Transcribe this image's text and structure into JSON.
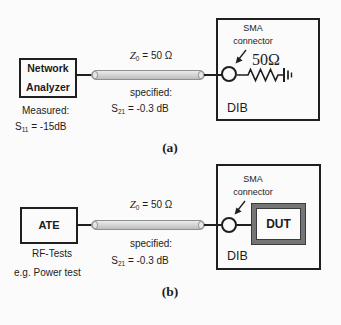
{
  "figure": {
    "colors": {
      "stroke": "#1f1f1f",
      "coax_fill": "#d6d6d6",
      "coax_border": "#8f8f8f",
      "dut_border": "#757575",
      "background": "#fbfbfb"
    },
    "panel_a": {
      "device_line1": "Network",
      "device_line2": "Analyzer",
      "impedance_symbol": "Z",
      "impedance_sub": "0",
      "impedance_value": "= 50 Ω",
      "specified_label": "specified:",
      "s21_symbol": "S",
      "s21_sub": "21",
      "s21_value": "= -0.3 dB",
      "measured_label": "Measured:",
      "s11_symbol": "S",
      "s11_sub": "11",
      "s11_value": "= -15dB",
      "sma_line1": "SMA",
      "sma_line2": "connector",
      "resistor_label": "50Ω",
      "dib_label": "DIB",
      "caption": "(a)"
    },
    "panel_b": {
      "device": "ATE",
      "impedance_symbol": "Z",
      "impedance_sub": "0",
      "impedance_value": "= 50 Ω",
      "specified_label": "specified:",
      "s21_symbol": "S",
      "s21_sub": "21",
      "s21_value": "= -0.3 dB",
      "rf_label": "RF-Tests",
      "example_label": "e.g. Power test",
      "sma_line1": "SMA",
      "sma_line2": "connector",
      "dut_label": "DUT",
      "dib_label": "DIB",
      "caption": "(b)"
    }
  }
}
